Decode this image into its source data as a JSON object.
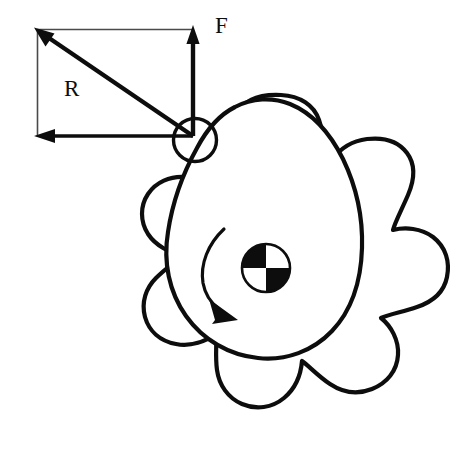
{
  "figure": {
    "background_color": "#ffffff",
    "stroke_color": "#0d0d0d",
    "width": 454,
    "height": 468
  },
  "labels": {
    "force_label": "F",
    "radius_label": "R"
  },
  "vectors": {
    "force": {
      "name": "F",
      "description": "Vertical force vector pointing up",
      "tail": {
        "x": 193,
        "y": 136
      },
      "head": {
        "x": 193,
        "y": 28
      },
      "arrowhead": "up"
    },
    "radius": {
      "name": "R",
      "description": "Diagonal radius vector pointing up-left from contact point",
      "tail": {
        "x": 193,
        "y": 136
      },
      "head": {
        "x": 37,
        "y": 30
      },
      "arrowhead": "up-left"
    },
    "horizontal": {
      "name": "horizontal-component",
      "description": "Horizontal component arrow pointing left",
      "tail": {
        "x": 193,
        "y": 136
      },
      "head": {
        "x": 37,
        "y": 136
      },
      "arrowhead": "left"
    }
  },
  "construction": {
    "rectangle": {
      "left": 37,
      "top": 29,
      "right": 193,
      "bottom": 136,
      "description": "Thin construction rectangle for vector components"
    }
  },
  "roller": {
    "name": "contact-roller",
    "center": {
      "x": 195,
      "y": 140
    },
    "radius": 22,
    "description": "Small open circle at the force application point on the cam lobe"
  },
  "hub": {
    "name": "quartered-hub",
    "center": {
      "x": 266,
      "y": 268
    },
    "radius": 24,
    "pattern": "checkered-quadrants",
    "quadrant_fill": {
      "top_left": "#0d0d0d",
      "top_right": "#ffffff",
      "bottom_left": "#ffffff",
      "bottom_right": "#0d0d0d"
    }
  },
  "rotation_arrow": {
    "name": "rotation-direction-arrow",
    "direction": "clockwise-downward",
    "start": {
      "x": 224,
      "y": 228
    },
    "end": {
      "x": 225,
      "y": 313
    },
    "arrowhead": "down-right"
  },
  "sprocket": {
    "name": "outer-sprocket-lobes",
    "lobe_count": 8,
    "center": {
      "x": 266,
      "y": 268
    },
    "description": "Eight rounded lobes forming a flower-shaped sprocket outline"
  },
  "cam": {
    "name": "inner-cam-profile",
    "shape": "teardrop",
    "description": "Egg / teardrop shaped inner cam outline whose narrow tip meets the roller"
  }
}
